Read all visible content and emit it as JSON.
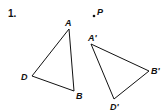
{
  "problem": {
    "number": "1.",
    "point_label": "P",
    "triangle_original": {
      "vertices": [
        {
          "label": "A",
          "x": 69,
          "y": 29
        },
        {
          "label": "B",
          "x": 74,
          "y": 91
        },
        {
          "label": "D",
          "x": 32,
          "y": 76
        }
      ]
    },
    "triangle_image": {
      "vertices": [
        {
          "label": "A'",
          "x": 91,
          "y": 44
        },
        {
          "label": "B'",
          "x": 149,
          "y": 71
        },
        {
          "label": "D'",
          "x": 114,
          "y": 99
        }
      ]
    }
  }
}
